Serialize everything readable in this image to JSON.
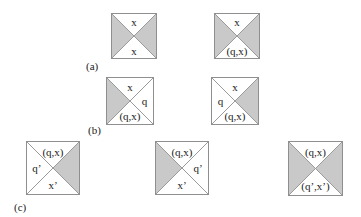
{
  "colors": {
    "shade": "#c9c9c9",
    "border": "#8f8f8f",
    "diag": "#9a9a9a"
  },
  "panels": [
    {
      "label": "(a)",
      "x": 86,
      "y": 61
    },
    {
      "label": "(b)",
      "x": 88,
      "y": 125
    },
    {
      "label": "(c)",
      "x": 14,
      "y": 202
    }
  ],
  "tiles": [
    {
      "id": "a1",
      "x": 111,
      "y": 13,
      "size": 46,
      "shaded": [
        "left",
        "right"
      ],
      "labels": {
        "top": "x",
        "bottom": "x"
      }
    },
    {
      "id": "a2",
      "x": 214,
      "y": 13,
      "size": 46,
      "shaded": [
        "left",
        "right"
      ],
      "labels": {
        "top": "x",
        "bottom": "(q,x)"
      }
    },
    {
      "id": "b1",
      "x": 106,
      "y": 77,
      "size": 48,
      "shaded": [
        "left"
      ],
      "labels": {
        "top": "x",
        "right": "q",
        "bottom": "(q,x)"
      }
    },
    {
      "id": "b2",
      "x": 211,
      "y": 77,
      "size": 48,
      "shaded": [
        "right"
      ],
      "labels": {
        "top": "x",
        "left": "q",
        "bottom": "(q,x)"
      }
    },
    {
      "id": "c1",
      "x": 26,
      "y": 141,
      "size": 54,
      "shaded": [
        "right"
      ],
      "labels": {
        "top": "(q,x)",
        "left": "q’",
        "bottom": "x’"
      }
    },
    {
      "id": "c2",
      "x": 155,
      "y": 141,
      "size": 54,
      "shaded": [
        "left"
      ],
      "labels": {
        "top": "(q,x)",
        "right": "q’",
        "bottom": "x’"
      }
    },
    {
      "id": "c3",
      "x": 288,
      "y": 141,
      "size": 55,
      "shaded": [
        "left",
        "right"
      ],
      "labels": {
        "top": "(q,x)",
        "bottom": "(q’,x’)"
      }
    }
  ]
}
